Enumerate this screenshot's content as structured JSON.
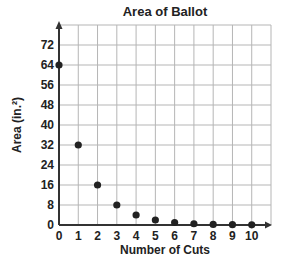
{
  "chart_data": {
    "type": "scatter",
    "title": "Area of Ballot",
    "xlabel": "Number of Cuts",
    "ylabel": "Area (in.²)",
    "xlim": [
      0,
      11
    ],
    "ylim": [
      0,
      80
    ],
    "xticks": [
      0,
      1,
      2,
      3,
      4,
      5,
      6,
      7,
      8,
      9,
      10
    ],
    "yticks": [
      0,
      8,
      16,
      24,
      32,
      40,
      48,
      56,
      64,
      72
    ],
    "grid": true,
    "legend": "none",
    "series": [
      {
        "name": "Area",
        "x": [
          0,
          1,
          2,
          3,
          4,
          5,
          6,
          7,
          8,
          9,
          10
        ],
        "y": [
          64,
          32,
          16,
          8,
          4,
          2,
          1,
          0.5,
          0.25,
          0.125,
          0.0625
        ]
      }
    ]
  }
}
